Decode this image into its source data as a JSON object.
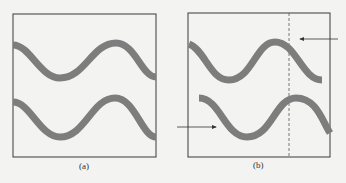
{
  "panels": [
    {
      "id": "a",
      "caption": "(a)"
    },
    {
      "id": "b",
      "caption": "(b)"
    }
  ],
  "colors": {
    "background": "#f3f3f1",
    "frame": "#3a3a3a",
    "wave": "#7d7d7d",
    "arrow": "#333333",
    "dashed_line": "#555555"
  },
  "annotations": {
    "dashed_vertical_line": "reference line in panel (b)",
    "arrow_top": "points left at top wave crest in panel (b)",
    "arrow_bottom": "points right at start of bottom wave in panel (b)"
  }
}
